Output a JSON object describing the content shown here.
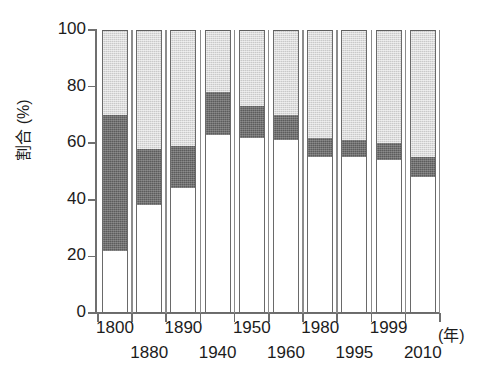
{
  "chart_data": {
    "type": "bar",
    "subtype": "stacked-bar-100-percent",
    "title": "",
    "xlabel": "(年)",
    "ylabel": "割合 (%)",
    "ylim": [
      0,
      100
    ],
    "yticks": [
      0,
      20,
      40,
      60,
      80,
      100
    ],
    "grid": false,
    "legend": "none",
    "categories": [
      "1800",
      "1880",
      "1890",
      "1940",
      "1950",
      "1960",
      "1980",
      "1995",
      "1999",
      "2010"
    ],
    "category_rows": [
      {
        "row": "upper",
        "labels": [
          "1800",
          "1890",
          "1950",
          "1980",
          "1999"
        ]
      },
      {
        "row": "lower",
        "labels": [
          "1880",
          "1940",
          "1960",
          "1995",
          "2010"
        ]
      }
    ],
    "series": [
      {
        "name": "bottom-white",
        "fill": "#ffffff",
        "values": [
          22,
          38,
          44,
          63,
          62,
          61,
          55,
          55,
          54,
          48
        ]
      },
      {
        "name": "middle-dark-gray",
        "fill": "#5c5c5c",
        "values": [
          48,
          20,
          15,
          15,
          11,
          9,
          7,
          6,
          6,
          7
        ]
      },
      {
        "name": "top-light-gray",
        "fill": "#c9c9c9",
        "values": [
          30,
          42,
          41,
          22,
          27,
          30,
          38,
          39,
          40,
          45
        ]
      }
    ],
    "cumulative_tops": {
      "bottom_white": [
        22,
        38,
        44,
        63,
        62,
        61,
        55,
        55,
        54,
        48
      ],
      "middle_dark": [
        70,
        58,
        59,
        78,
        73,
        70,
        62,
        61,
        60,
        55
      ],
      "top_light": [
        100,
        100,
        100,
        100,
        100,
        100,
        100,
        100,
        100,
        100
      ]
    }
  },
  "axes": {
    "y_title": "割合 (%)",
    "y_tick_labels": [
      "100",
      "80",
      "60",
      "40",
      "20",
      "0"
    ],
    "x_unit_label": "(年)"
  },
  "colors": {
    "segment_top": "#c9c9c9",
    "segment_middle": "#5c5c5c",
    "segment_bottom": "#ffffff",
    "outline": "#6a6a6a",
    "axis": "#6f6f6f",
    "text": "#1c1c1c",
    "background": "#ffffff"
  }
}
